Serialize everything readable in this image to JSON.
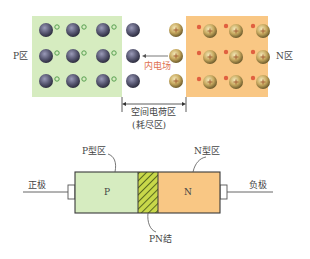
{
  "top_diagram": {
    "p_region_label": "P区",
    "n_region_label": "N区",
    "field_label": "内电场",
    "space_charge_label": "空间电荷区",
    "depletion_label": "(耗尽区)",
    "colors": {
      "p_region": "#d6ecc0",
      "n_region": "#f9c784",
      "acceptor_ion": "#5a5a6e",
      "donor_ion": "#b8a060",
      "hole": "#58a050",
      "electron": "#e06040",
      "field_text": "#e07050"
    },
    "p_side": {
      "ion_columns_with_holes": 3,
      "ion_columns_depleted": 1,
      "rows": 3
    },
    "n_side": {
      "ion_columns_with_electrons": 3,
      "ion_columns_depleted": 1,
      "rows": 3
    }
  },
  "bottom_diagram": {
    "p_type_label": "P型区",
    "n_type_label": "N型区",
    "p_letter": "P",
    "n_letter": "N",
    "junction_label": "PN结",
    "anode_label": "正极",
    "cathode_label": "负极"
  }
}
